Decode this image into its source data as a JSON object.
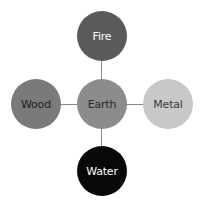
{
  "diagram": {
    "title": "",
    "center": {
      "label": "Earth",
      "color": "#8c8c8c",
      "text_color": "#2a2a2a"
    },
    "nodes": [
      {
        "id": "fire",
        "label": "Fire",
        "position": "top",
        "color": "#5a5a5a",
        "text_color": "#ffffff"
      },
      {
        "id": "wood",
        "label": "Wood",
        "position": "left",
        "color": "#7a7a7a",
        "text_color": "#1e1e1e"
      },
      {
        "id": "metal",
        "label": "Metal",
        "position": "right",
        "color": "#c8c8c8",
        "text_color": "#3a3a3a"
      },
      {
        "id": "water",
        "label": "Water",
        "position": "bottom",
        "color": "#080808",
        "text_color": "#ffffff"
      }
    ],
    "edges": [
      {
        "from": "Earth",
        "to": "Fire"
      },
      {
        "from": "Earth",
        "to": "Wood"
      },
      {
        "from": "Earth",
        "to": "Metal"
      },
      {
        "from": "Earth",
        "to": "Water"
      }
    ]
  }
}
